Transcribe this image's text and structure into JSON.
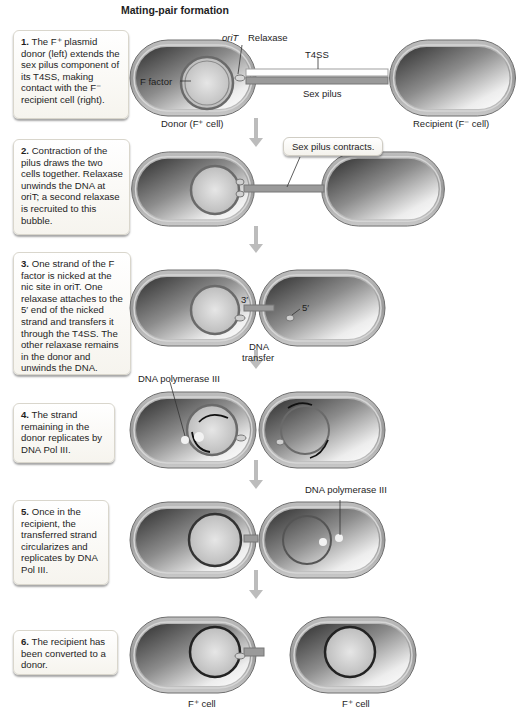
{
  "title": "Mating-pair formation",
  "steps": [
    {
      "num": "1.",
      "text": "The F⁺ plasmid donor (left) extends the sex pilus component of its T4SS, making contact with the F⁻ recipient cell (right)."
    },
    {
      "num": "2.",
      "text": "Contraction of the pilus draws the two cells together. Relaxase unwinds the DNA at oriT; a second relaxase is recruited to this bubble."
    },
    {
      "num": "3.",
      "text": "One strand of the F factor is nicked at the nic site in oriT. One relaxase attaches to the 5′ end of the nicked strand and transfers it through the T4SS. The other relaxase remains in the donor and unwinds the DNA."
    },
    {
      "num": "4.",
      "text": "The strand remaining in the donor replicates by DNA Pol III."
    },
    {
      "num": "5.",
      "text": "Once in the recipient, the transferred strand circularizes and replicates by DNA Pol III."
    },
    {
      "num": "6.",
      "text": "The recipient has been converted to a donor."
    }
  ],
  "labels": {
    "oriT": "oriT",
    "relaxase": "Relaxase",
    "t4ss": "T4SS",
    "f_factor": "F factor",
    "sex_pilus": "Sex pilus",
    "donor": "Donor (F⁺ cell)",
    "recipient": "Recipient (F⁻ cell)",
    "pilus_contracts": "Sex pilus contracts.",
    "three_prime": "3′",
    "five_prime": "5′",
    "dna_transfer_1": "DNA",
    "dna_transfer_2": "transfer",
    "dna_pol_3_a": "DNA polymerase III",
    "dna_pol_3_b": "DNA polymerase III",
    "fplus_cell_left": "F⁺ cell",
    "fplus_cell_right": "F⁺ cell"
  },
  "colors": {
    "cell_dark": "#2a2a2a",
    "cell_light": "#f2f2f2",
    "membrane": "#8a8a8a",
    "arrow": "#b8b8b8",
    "box_border": "#d9d6cc"
  }
}
